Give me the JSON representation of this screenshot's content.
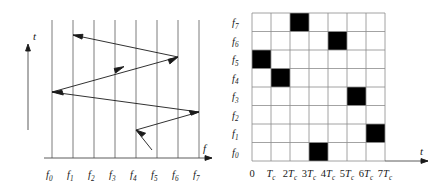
{
  "figure": {
    "left_panel": {
      "y_axis_label": "t",
      "x_axis_label": "f",
      "frequency_labels": [
        {
          "base": "f",
          "sub": "0"
        },
        {
          "base": "f",
          "sub": "1"
        },
        {
          "base": "f",
          "sub": "2"
        },
        {
          "base": "f",
          "sub": "3"
        },
        {
          "base": "f",
          "sub": "4"
        },
        {
          "base": "f",
          "sub": "5"
        },
        {
          "base": "f",
          "sub": "6"
        },
        {
          "base": "f",
          "sub": "7"
        }
      ],
      "hop_path_points": "start f5 bottom, f4, f7, f0, f6, f1",
      "line_color": "#1a1a1a"
    },
    "right_panel": {
      "y_axis_label": "t",
      "frequency_labels": [
        {
          "base": "f",
          "sub": "7"
        },
        {
          "base": "f",
          "sub": "6"
        },
        {
          "base": "f",
          "sub": "5"
        },
        {
          "base": "f",
          "sub": "4"
        },
        {
          "base": "f",
          "sub": "3"
        },
        {
          "base": "f",
          "sub": "2"
        },
        {
          "base": "f",
          "sub": "1"
        },
        {
          "base": "f",
          "sub": "0"
        }
      ],
      "time_labels": [
        {
          "num": "0",
          "base": "",
          "sub": ""
        },
        {
          "num": "",
          "base": "T",
          "sub": "c"
        },
        {
          "num": "2",
          "base": "T",
          "sub": "c"
        },
        {
          "num": "3",
          "base": "T",
          "sub": "c"
        },
        {
          "num": "4",
          "base": "T",
          "sub": "c"
        },
        {
          "num": "5",
          "base": "T",
          "sub": "c"
        },
        {
          "num": "6",
          "base": "T",
          "sub": "c"
        },
        {
          "num": "7",
          "base": "T",
          "sub": "c"
        }
      ],
      "fill_color": "#000000",
      "grid_color": "#8c8c8c"
    }
  },
  "chart_data": {
    "type": "heatmap",
    "title": "",
    "xlabel": "t",
    "ylabel": "f",
    "grid": true,
    "legend": "none",
    "x_tick_labels": [
      "0",
      "Tc",
      "2Tc",
      "3Tc",
      "4Tc",
      "5Tc",
      "6Tc",
      "7Tc"
    ],
    "y_tick_labels": [
      "f7",
      "f6",
      "f5",
      "f4",
      "f3",
      "f2",
      "f1",
      "f0"
    ],
    "columns": 7,
    "rows": 8,
    "cells": [
      [
        0,
        0,
        1,
        0,
        0,
        0,
        0
      ],
      [
        0,
        0,
        0,
        0,
        1,
        0,
        0
      ],
      [
        1,
        0,
        0,
        0,
        0,
        0,
        0
      ],
      [
        0,
        1,
        0,
        0,
        0,
        0,
        0
      ],
      [
        0,
        0,
        0,
        0,
        0,
        1,
        0
      ],
      [
        0,
        0,
        0,
        0,
        0,
        0,
        0
      ],
      [
        0,
        0,
        0,
        0,
        0,
        0,
        1
      ],
      [
        0,
        0,
        0,
        1,
        0,
        0,
        0
      ]
    ],
    "hop_sequence_by_slot": [
      "f5",
      "f4",
      "f7",
      "f0",
      "f6",
      "f3",
      "f1"
    ],
    "series": [
      {
        "name": "frequency hop",
        "x": [
          0,
          1,
          2,
          3,
          4,
          5,
          6
        ],
        "values": [
          5,
          4,
          7,
          0,
          6,
          3,
          1
        ]
      }
    ]
  }
}
